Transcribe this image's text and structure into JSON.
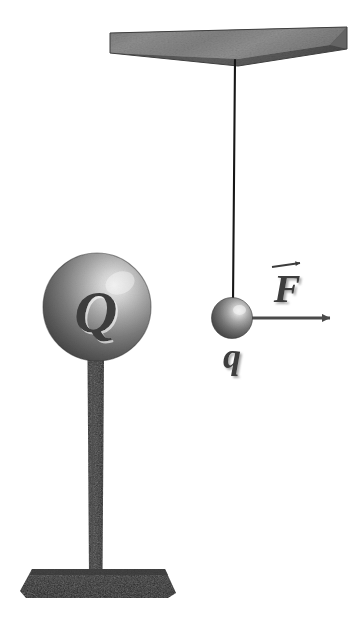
{
  "figure": {
    "background_color": "#ffffff",
    "width": 352,
    "height": 621
  },
  "labels": {
    "large_sphere_charge": "Q",
    "small_sphere_charge": "q",
    "force_vector": "F"
  },
  "colors": {
    "slab_light": "#8e8e8e",
    "slab_mid": "#6f6f6f",
    "slab_dark": "#4e4e4e",
    "sphere_highlight": "#f2f2f2",
    "sphere_mid": "#9a9a9a",
    "sphere_dark": "#4a4a4a",
    "sphere_edge": "#2e2e2e",
    "post_dark": "#2a2a2a",
    "post_mid": "#3a3a3a",
    "base_dark": "#262626",
    "string": "#1a1a1a",
    "arrow": "#4a4a4a",
    "label_text": "#3c3c3c"
  },
  "elements": {
    "ceiling_slab": {
      "name": "ceiling support slab",
      "top_left_x": 110,
      "top_left_y": 33,
      "right_x": 347,
      "right_y": 27
    },
    "string": {
      "name": "suspension string",
      "top_x": 235,
      "top_y": 60,
      "bottom_x": 233,
      "bottom_y": 302
    },
    "small_sphere": {
      "name": "charged pendulum ball",
      "center_x": 232,
      "center_y": 318,
      "radius": 20
    },
    "large_sphere": {
      "name": "charged sphere on stand",
      "center_x": 97,
      "center_y": 307,
      "radius": 54
    },
    "post": {
      "name": "stand post",
      "left_x": 87,
      "right_x": 104,
      "top_y": 358,
      "bottom_y": 573
    },
    "base": {
      "name": "stand base",
      "left_x": 20,
      "right_x": 176,
      "top_y": 569,
      "bottom_y": 598
    },
    "force_arrow": {
      "name": "force vector arrow",
      "start_x": 252,
      "start_y": 318,
      "tip_x": 338,
      "tip_y": 318
    }
  }
}
